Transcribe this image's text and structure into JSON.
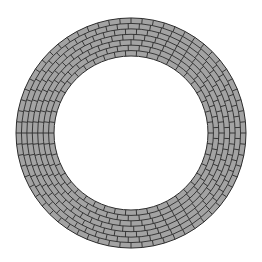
{
  "figure": {
    "colors": {
      "background": "#ffffff",
      "brick_fill": "#a3a3a3",
      "mortar": "#2b2b2b"
    },
    "ring": {
      "center_x": 131,
      "center_y": 133,
      "outer_radius": 115,
      "inner_radius": 77,
      "brick_rows": 7
    }
  }
}
